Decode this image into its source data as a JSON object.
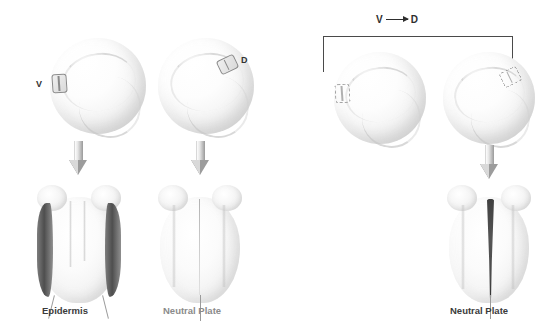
{
  "figure": {
    "background_color": "#ffffff",
    "text_color_dark": "#3b3b3b",
    "text_color_gray": "#8b8b8b"
  },
  "panels": [
    {
      "id": "control-ventral",
      "blastula": {
        "graft_label": "V",
        "graft_position": "left-lateral",
        "graft_style": "solid"
      },
      "arrow": "down-arrow-icon",
      "neurula": {
        "feature": "dark-lateral-bands",
        "caption": "Epidermis",
        "caption_tone": "dark",
        "leader_lines": 2
      }
    },
    {
      "id": "control-dorsal",
      "blastula": {
        "graft_label": "D",
        "graft_position": "upper-right",
        "graft_style": "solid"
      },
      "arrow": "down-arrow-icon",
      "neurula": {
        "feature": "pale-uniform",
        "caption": "Neutral Plate",
        "caption_tone": "gray",
        "leader_lines": 1
      }
    },
    {
      "id": "transplant-v-to-d",
      "transfer": {
        "from_label": "V",
        "to_label": "D",
        "arrow_glyph": "right-arrow-icon"
      },
      "donor": {
        "graft_label": "",
        "graft_position": "left-lateral",
        "graft_style": "dashed"
      },
      "host": {
        "graft_label": "",
        "graft_position": "upper-right",
        "graft_style": "dashed"
      },
      "arrow": "down-arrow-icon",
      "neurula": {
        "feature": "dark-neural-plate-stripe",
        "caption": "Neutral Plate",
        "caption_tone": "dark",
        "leader_lines": 1
      }
    }
  ]
}
